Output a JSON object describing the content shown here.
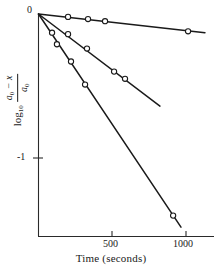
{
  "figure": {
    "background": "#ffffff",
    "ink": "#1a1a1a"
  },
  "axes": {
    "x_label": "Time (seconds)",
    "x_ticks": [
      {
        "value": 500,
        "label": "500",
        "px": 112
      },
      {
        "value": 1000,
        "label": "1000",
        "px": 186
      }
    ],
    "x_range": [
      0,
      1240
    ],
    "y_ticks": [
      {
        "value": 0,
        "label": "0",
        "px": 14
      },
      {
        "value": -1,
        "label": "-1",
        "px": 158
      }
    ],
    "y_range": [
      -1.55,
      0.0
    ],
    "y_label_parts": {
      "log": "log",
      "log_base": "10",
      "numerator": "a",
      "numerator_sub": "0",
      "numerator_tail": "− x",
      "denominator": "a",
      "denominator_sub": "0"
    },
    "grid": "off",
    "origin_px": {
      "x": 38,
      "y": 14
    }
  },
  "chart_data": {
    "type": "line",
    "title": "",
    "xlabel": "Time (seconds)",
    "ylabel": "log10 (a0 - x) / a0",
    "xlim": [
      0,
      1240
    ],
    "ylim": [
      -1.55,
      0.0
    ],
    "grid": false,
    "legend": "none",
    "marker": "open-circle",
    "series": [
      {
        "name": "slowest-run",
        "slope_per_second": -0.00012,
        "points": [
          {
            "x": 0,
            "y": 0.0
          },
          {
            "x": 203,
            "y": -0.02
          },
          {
            "x": 338,
            "y": -0.035
          },
          {
            "x": 453,
            "y": -0.05
          },
          {
            "x": 1014,
            "y": -0.12
          }
        ],
        "line_end": {
          "x": 1128,
          "y": -0.13
        }
      },
      {
        "name": "intermediate-run",
        "slope_per_second": -0.00089,
        "points": [
          {
            "x": 0,
            "y": 0.0
          },
          {
            "x": 203,
            "y": -0.14
          },
          {
            "x": 331,
            "y": -0.24
          },
          {
            "x": 514,
            "y": -0.4
          },
          {
            "x": 588,
            "y": -0.45
          }
        ],
        "line_end": {
          "x": 824,
          "y": -0.64
        }
      },
      {
        "name": "fastest-run",
        "slope_per_second": -0.00177,
        "points": [
          {
            "x": 0,
            "y": 0.0
          },
          {
            "x": 95,
            "y": -0.13
          },
          {
            "x": 128,
            "y": -0.21
          },
          {
            "x": 223,
            "y": -0.33
          },
          {
            "x": 318,
            "y": -0.49
          },
          {
            "x": 913,
            "y": -1.4
          }
        ],
        "line_end": {
          "x": 966,
          "y": -1.48
        }
      }
    ]
  }
}
